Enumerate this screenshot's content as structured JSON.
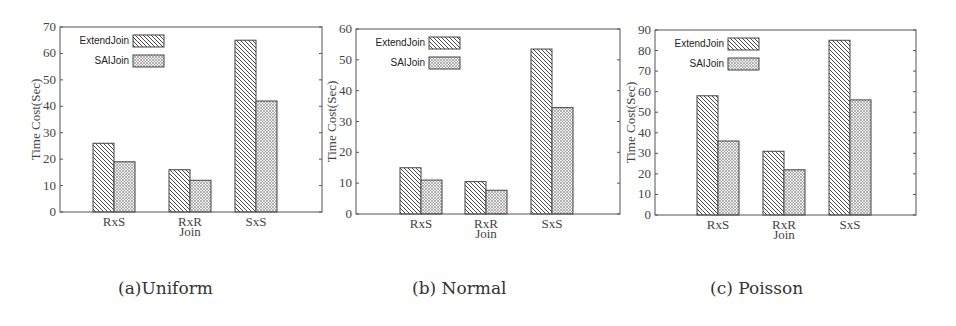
{
  "chart_data": [
    {
      "type": "bar",
      "title": "",
      "caption": "(a)Uniform",
      "xlabel": "Join",
      "ylabel": "Time Cost(Sec)",
      "categories": [
        "RxS",
        "RxR",
        "SxS"
      ],
      "ylim": [
        0,
        70
      ],
      "yticks": [
        0,
        10,
        20,
        30,
        40,
        50,
        60,
        70
      ],
      "grid": false,
      "legend_position": "upper left",
      "series": [
        {
          "name": "ExtendJoin",
          "pattern": "diagonal-hatch",
          "values": [
            26,
            16,
            65
          ]
        },
        {
          "name": "SAIJoin",
          "pattern": "crosshatch",
          "values": [
            19,
            12,
            42
          ]
        }
      ]
    },
    {
      "type": "bar",
      "title": "",
      "caption": "(b) Normal",
      "xlabel": "Join",
      "ylabel": "Time Cost(Sec)",
      "categories": [
        "RxS",
        "RxR",
        "SxS"
      ],
      "ylim": [
        0,
        60
      ],
      "yticks": [
        0,
        10,
        20,
        30,
        40,
        50,
        60
      ],
      "grid": false,
      "legend_position": "upper left",
      "series": [
        {
          "name": "ExtendJoin",
          "pattern": "diagonal-hatch",
          "values": [
            15,
            10.5,
            53.5
          ]
        },
        {
          "name": "SAIJoin",
          "pattern": "crosshatch",
          "values": [
            11,
            7.7,
            34.5
          ]
        }
      ]
    },
    {
      "type": "bar",
      "title": "",
      "caption": "(c) Poisson",
      "xlabel": "Join",
      "ylabel": "Time Cost(Sec)",
      "categories": [
        "RxS",
        "RxR",
        "SxS"
      ],
      "ylim": [
        0,
        90
      ],
      "yticks": [
        0,
        10,
        20,
        30,
        40,
        50,
        60,
        70,
        80,
        90
      ],
      "grid": false,
      "legend_position": "upper left",
      "series": [
        {
          "name": "ExtendJoin",
          "pattern": "diagonal-hatch",
          "values": [
            58,
            31,
            85
          ]
        },
        {
          "name": "SAIJoin",
          "pattern": "crosshatch",
          "values": [
            36,
            22,
            56
          ]
        }
      ]
    }
  ],
  "captions": [
    "(a)Uniform",
    "(b) Normal",
    "(c) Poisson"
  ],
  "colors": {
    "axis": "#555555",
    "bar_stroke": "#444444",
    "background": "#ffffff"
  }
}
